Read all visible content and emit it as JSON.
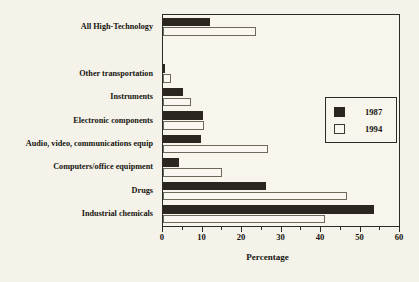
{
  "chart_data": {
    "type": "bar",
    "orientation": "horizontal",
    "title": "",
    "xlabel": "Percentage",
    "ylabel": "",
    "xlim": [
      0,
      60
    ],
    "xticks": [
      0,
      10,
      20,
      30,
      40,
      50,
      60
    ],
    "xtick_labels": [
      "0",
      "10",
      "20",
      "30",
      "40",
      "50",
      "60"
    ],
    "minor_tick_step": 5,
    "grid": false,
    "legend_position": "right-upper",
    "categories": [
      "All High-Technology",
      "",
      "Other transportation",
      "Instruments",
      "Electronic components",
      "Audio, video, communications equip",
      "Computers/office equipment",
      "Drugs",
      "Industrial chemicals"
    ],
    "series": [
      {
        "name": "1987",
        "color": "#2b2720",
        "values": [
          12.0,
          null,
          0.3,
          5.0,
          10.0,
          9.5,
          4.0,
          26.0,
          53.5
        ]
      },
      {
        "name": "1994",
        "color": "#f9f7ef",
        "values": [
          23.5,
          null,
          2.0,
          7.0,
          10.5,
          26.5,
          15.0,
          46.5,
          41.0
        ]
      }
    ]
  },
  "legend": {
    "entries": [
      {
        "label": "1987",
        "swatch": "filled-black-swatch"
      },
      {
        "label": "1994",
        "swatch": "open-white-swatch"
      }
    ]
  },
  "axis": {
    "x_title": "Percentage"
  }
}
